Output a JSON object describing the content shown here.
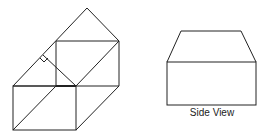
{
  "diagram": {
    "left_figure": {
      "name": "isometric-prism-with-roof",
      "right_angle_marker": true
    },
    "right_figure": {
      "name": "side-view",
      "label": "Side View"
    }
  },
  "colors": {
    "stroke": "#222222",
    "background": "#ffffff"
  }
}
